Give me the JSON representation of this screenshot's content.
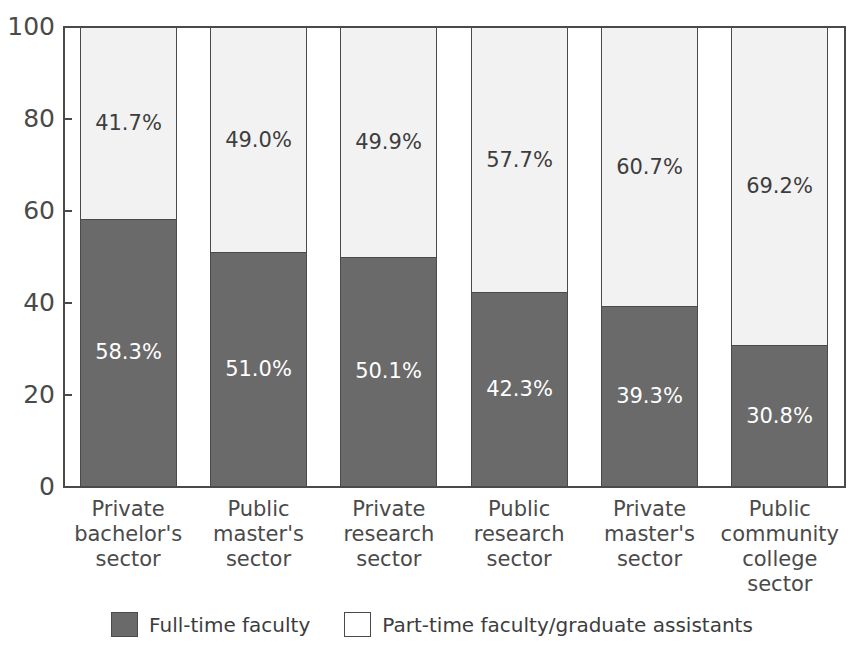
{
  "chart_data": {
    "type": "bar",
    "subtype": "stacked-100-percent",
    "title": "",
    "xlabel": "",
    "ylabel": "",
    "ylim": [
      0,
      100
    ],
    "yticks": [
      0,
      20,
      40,
      60,
      80,
      100
    ],
    "ytick_labels": [
      "0",
      "20",
      "40",
      "60",
      "80",
      "100"
    ],
    "grid": false,
    "legend_position": "bottom-center",
    "categories": [
      "Private bachelor's sector",
      "Public master's sector",
      "Private research sector",
      "Public research sector",
      "Private master's sector",
      "Public community college sector"
    ],
    "category_lines": [
      [
        "Private",
        "bachelor's",
        "sector"
      ],
      [
        "Public",
        "master's",
        "sector"
      ],
      [
        "Private",
        "research",
        "sector"
      ],
      [
        "Public",
        "research",
        "sector"
      ],
      [
        "Private",
        "master's",
        "sector"
      ],
      [
        "Public",
        "community",
        "college",
        "sector"
      ]
    ],
    "series": [
      {
        "name": "Full-time faculty",
        "color": "#6a6a6a",
        "values": [
          58.3,
          51.0,
          50.1,
          42.3,
          39.3,
          30.8
        ],
        "labels": [
          "58.3%",
          "51.0%",
          "50.1%",
          "42.3%",
          "39.3%",
          "30.8%"
        ]
      },
      {
        "name": "Part-time faculty/graduate assistants",
        "color": "#f2f2f2",
        "values": [
          41.7,
          49.0,
          49.9,
          57.7,
          60.7,
          69.2
        ],
        "labels": [
          "41.7%",
          "49.0%",
          "49.9%",
          "57.7%",
          "60.7%",
          "69.2%"
        ]
      }
    ]
  },
  "legend": {
    "items": [
      {
        "label": "Full-time faculty",
        "swatch": "dark-gray-swatch"
      },
      {
        "label": "Part-time faculty/graduate assistants",
        "swatch": "white-swatch"
      }
    ]
  },
  "colors": {
    "full_time": "#6a6a6a",
    "part_time": "#f2f2f2",
    "axis": "#4a4a4a",
    "text": "#3d3d3d",
    "background": "#ffffff"
  }
}
